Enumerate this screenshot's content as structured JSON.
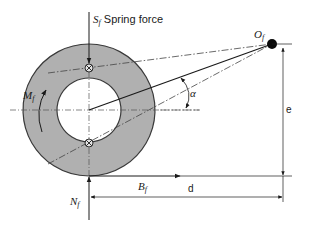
{
  "diagram": {
    "colors": {
      "ring_fill": "#b0b0b0",
      "ring_stroke": "#3a3a3a",
      "line": "#1a1a1a",
      "centerline": "#555555",
      "background": "#ffffff"
    },
    "labels": {
      "spring_force_symbol": "S",
      "spring_force_sub": "f",
      "spring_force_text": "Spring force",
      "pivot_symbol": "O",
      "pivot_sub": "f",
      "moment_symbol": "M",
      "moment_sub": "f",
      "angle": "α",
      "brake_force_symbol": "B",
      "brake_force_sub": "f",
      "normal_force_symbol": "N",
      "normal_force_sub": "f",
      "dim_d": "d",
      "dim_e": "e"
    }
  }
}
